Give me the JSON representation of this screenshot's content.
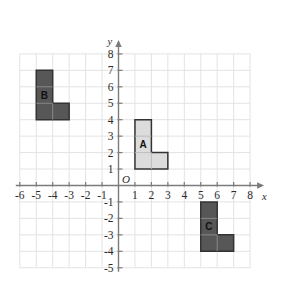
{
  "figure": {
    "kind": "coordinate-grid-shapes",
    "background_color": "#ffffff",
    "grid_color": "#e3e3e3",
    "axis_color": "#7b7b7b"
  },
  "axes": {
    "x": {
      "name": "x",
      "min": -6,
      "max": 8,
      "tick_labels": [
        "-6",
        "-5",
        "-4",
        "-3",
        "-2",
        "-1",
        "1",
        "2",
        "3",
        "4",
        "5",
        "6",
        "7",
        "8"
      ],
      "tick_values": [
        -6,
        -5,
        -4,
        -3,
        -2,
        -1,
        1,
        2,
        3,
        4,
        5,
        6,
        7,
        8
      ]
    },
    "y": {
      "name": "y",
      "min": -5,
      "max": 8,
      "tick_labels": [
        "8",
        "7",
        "6",
        "5",
        "4",
        "3",
        "2",
        "1",
        "-1",
        "-2",
        "-3",
        "-4",
        "-5"
      ],
      "tick_values": [
        8,
        7,
        6,
        5,
        4,
        3,
        2,
        1,
        -1,
        -2,
        -3,
        -4,
        -5
      ]
    },
    "origin_label": "O"
  },
  "shapes": [
    {
      "label": "A",
      "fill": "#dcdcdc",
      "stroke": "#333333",
      "label_x": 1.5,
      "label_y": 2.5,
      "vertices": [
        [
          1,
          1
        ],
        [
          1,
          4
        ],
        [
          2,
          4
        ],
        [
          2,
          2
        ],
        [
          3,
          2
        ],
        [
          3,
          1
        ]
      ],
      "inner_lines": [
        [
          [
            1,
            2
          ],
          [
            2,
            2
          ]
        ],
        [
          [
            1,
            3
          ],
          [
            2,
            3
          ]
        ],
        [
          [
            2,
            1
          ],
          [
            2,
            2
          ]
        ]
      ]
    },
    {
      "label": "B",
      "fill": "#575757",
      "stroke": "#333333",
      "label_x": -4.5,
      "label_y": 5.5,
      "vertices": [
        [
          -5,
          4
        ],
        [
          -5,
          7
        ],
        [
          -4,
          7
        ],
        [
          -4,
          5
        ],
        [
          -3,
          5
        ],
        [
          -3,
          4
        ]
      ],
      "inner_lines": [
        [
          [
            -5,
            5
          ],
          [
            -4,
            5
          ]
        ],
        [
          [
            -5,
            6
          ],
          [
            -4,
            6
          ]
        ],
        [
          [
            -4,
            4
          ],
          [
            -4,
            5
          ]
        ]
      ]
    },
    {
      "label": "C",
      "fill": "#575757",
      "stroke": "#333333",
      "label_x": 5.5,
      "label_y": -2.5,
      "vertices": [
        [
          5,
          -4
        ],
        [
          5,
          -1
        ],
        [
          6,
          -1
        ],
        [
          6,
          -3
        ],
        [
          7,
          -3
        ],
        [
          7,
          -4
        ]
      ],
      "inner_lines": [
        [
          [
            5,
            -3
          ],
          [
            6,
            -3
          ]
        ],
        [
          [
            5,
            -2
          ],
          [
            6,
            -2
          ]
        ],
        [
          [
            6,
            -4
          ],
          [
            6,
            -3
          ]
        ]
      ]
    }
  ]
}
